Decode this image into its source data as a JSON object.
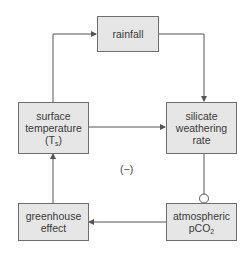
{
  "diagram": {
    "type": "feedback-loop",
    "nodes": [
      {
        "id": "rainfall",
        "lines": [
          "rainfall"
        ]
      },
      {
        "id": "surface_temperature",
        "lines": [
          "surface",
          "temperature"
        ],
        "sub_prefix": "(T",
        "sub": "s",
        "sub_suffix": ")"
      },
      {
        "id": "silicate_weathering_rate",
        "lines": [
          "silicate",
          "weathering",
          "rate"
        ]
      },
      {
        "id": "greenhouse_effect",
        "lines": [
          "greenhouse",
          "effect"
        ]
      },
      {
        "id": "atmospheric_pco2",
        "lines": [
          "atmospheric"
        ],
        "sub_prefix": "pCO",
        "sub": "2",
        "sub_suffix": ""
      }
    ],
    "edges": [
      {
        "from": "surface_temperature",
        "to": "rainfall",
        "type": "positive"
      },
      {
        "from": "rainfall",
        "to": "silicate_weathering_rate",
        "type": "positive"
      },
      {
        "from": "surface_temperature",
        "to": "silicate_weathering_rate",
        "type": "positive"
      },
      {
        "from": "silicate_weathering_rate",
        "to": "atmospheric_pco2",
        "type": "negative"
      },
      {
        "from": "atmospheric_pco2",
        "to": "greenhouse_effect",
        "type": "positive"
      },
      {
        "from": "greenhouse_effect",
        "to": "surface_temperature",
        "type": "positive"
      }
    ],
    "loop_sign": "(−)",
    "colors": {
      "box_fill": "#e6e6e6",
      "box_border": "#6e6e6e",
      "line": "#555555"
    }
  }
}
